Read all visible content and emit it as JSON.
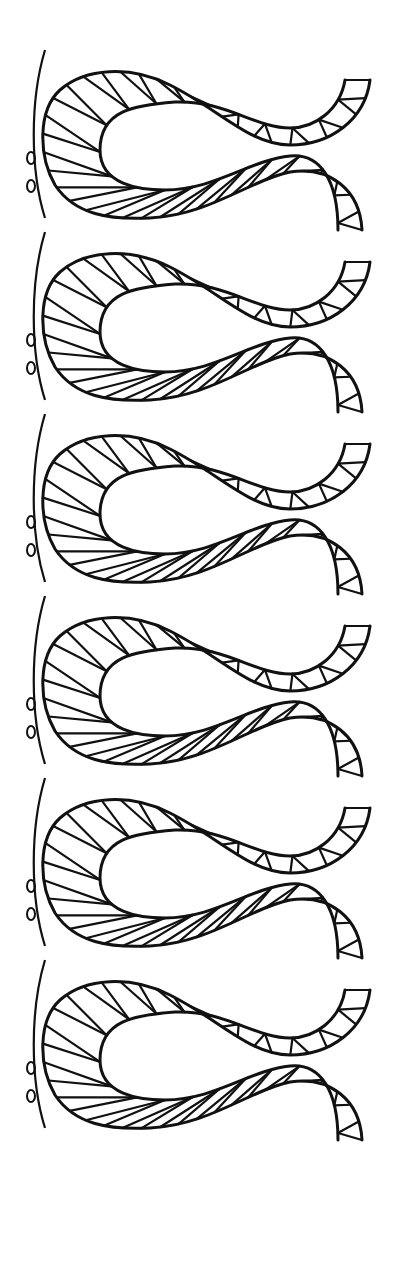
{
  "image": {
    "subject": "bobbin lace braid pattern",
    "colors": {
      "background": "#ffffff",
      "ink": "#111111"
    },
    "layout": {
      "width": 396,
      "height": 1287,
      "repeat_count": 6,
      "repeat_pitch": 182,
      "first_offset": 40
    }
  }
}
